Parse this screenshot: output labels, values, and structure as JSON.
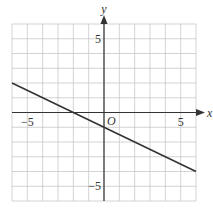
{
  "chart_data": {
    "type": "line",
    "title": "",
    "xlabel": "x",
    "ylabel": "y",
    "origin_label": "O",
    "xlim": [
      -6,
      6
    ],
    "ylim": [
      -6,
      6
    ],
    "grid": true,
    "x_ticks_labeled": [
      -5,
      5
    ],
    "y_ticks_labeled": [
      5,
      -5
    ],
    "tick_labels": {
      "x_neg": "−5",
      "x_pos": "5",
      "y_pos": "5",
      "y_neg": "−5"
    },
    "series": [
      {
        "name": "line",
        "equation": "y = -0.5x - 1",
        "x": [
          -6,
          -2,
          0,
          6
        ],
        "y": [
          2,
          0,
          -1,
          -4
        ]
      }
    ]
  },
  "colors": {
    "grid": "#c8c8c8",
    "axis": "#333333",
    "line": "#333333"
  }
}
